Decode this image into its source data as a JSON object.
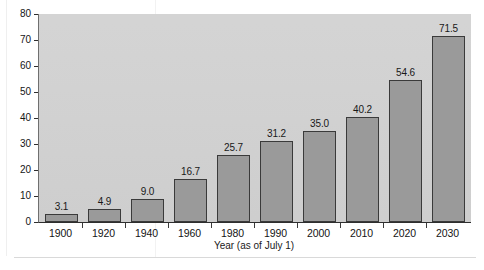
{
  "chart_data": {
    "type": "bar",
    "title": "",
    "xlabel": "Year (as of July 1)",
    "ylabel": "",
    "categories": [
      "1900",
      "1920",
      "1940",
      "1960",
      "1980",
      "1990",
      "2000",
      "2010",
      "2020",
      "2030"
    ],
    "values": [
      3.1,
      4.9,
      9.0,
      16.7,
      25.7,
      31.2,
      35.0,
      40.2,
      54.6,
      71.5
    ],
    "value_labels": [
      "3.1",
      "4.9",
      "9.0",
      "16.7",
      "25.7",
      "31.2",
      "35.0",
      "40.2",
      "54.6",
      "71.5"
    ],
    "ylim": [
      0,
      80
    ],
    "yticks": [
      0,
      10,
      20,
      30,
      40,
      50,
      60,
      70,
      80
    ],
    "ytick_labels": [
      "0",
      "10",
      "20",
      "30",
      "40",
      "50",
      "60",
      "70",
      "80"
    ],
    "grid": false,
    "legend": null,
    "colors": {
      "bar_fill": "#9a9a9a",
      "bar_edge": "#3a3a3a",
      "panel_background": "#d2d2d2",
      "page_background": "#ffffff",
      "text": "#1a1a1a",
      "axis": "#2e2e2e"
    }
  }
}
